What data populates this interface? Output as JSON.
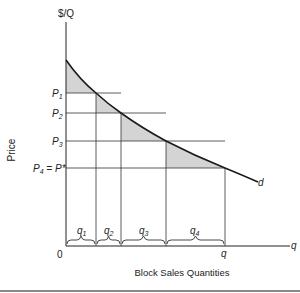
{
  "figure": {
    "y_axis_label": "$/Q",
    "y_axis_title": "Price",
    "x_axis_label": "q",
    "x_axis_title": "Block Sales Quantities",
    "origin_label": "0",
    "curve_label": "d",
    "price_levels": [
      {
        "label": "P",
        "sub": "1",
        "suffix": ""
      },
      {
        "label": "P",
        "sub": "2",
        "suffix": ""
      },
      {
        "label": "P",
        "sub": "3",
        "suffix": ""
      },
      {
        "label": "P",
        "sub": "4",
        "suffix": " = P*"
      }
    ],
    "blocks": [
      {
        "label": "q",
        "sub": "1"
      },
      {
        "label": "q",
        "sub": "2"
      },
      {
        "label": "q",
        "sub": "3"
      },
      {
        "label": "q",
        "sub": "4"
      }
    ],
    "q_marker_label": "q",
    "colors": {
      "shading": "#d4d4d4",
      "lines": "#333333",
      "curve": "#1a1a1a"
    }
  }
}
